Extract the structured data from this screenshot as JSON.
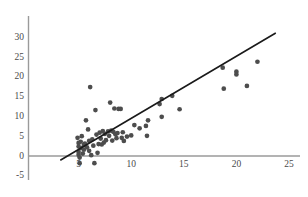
{
  "chart_data": {
    "type": "scatter",
    "title": "",
    "xlabel": "",
    "ylabel": "",
    "xlim": [
      0,
      25
    ],
    "ylim": [
      -5,
      30
    ],
    "xticks": [
      5,
      10,
      15,
      20,
      25
    ],
    "yticks": [
      -5,
      0,
      5,
      10,
      15,
      20,
      25,
      30
    ],
    "xtick_labels": [
      "5",
      "10",
      "15",
      "20",
      "25"
    ],
    "ytick_labels": [
      "-5",
      "0",
      "5",
      "10",
      "15",
      "20",
      "25",
      "30"
    ],
    "grid": false,
    "legend": null,
    "point_color": "#4d4d4d",
    "line_color": "#1a1a1a",
    "axis_color": "#9a9a9a",
    "series": [
      {
        "name": "observations",
        "marker": "circle",
        "points": [
          [
            4.9,
            4.6
          ],
          [
            5.0,
            3.3
          ],
          [
            5.0,
            2.4
          ],
          [
            5.0,
            1.0
          ],
          [
            5.0,
            0.3
          ],
          [
            5.1,
            -0.4
          ],
          [
            5.1,
            -1.8
          ],
          [
            5.2,
            2.0
          ],
          [
            5.2,
            3.6
          ],
          [
            5.3,
            5.0
          ],
          [
            5.4,
            0.6
          ],
          [
            5.5,
            2.8
          ],
          [
            5.5,
            1.6
          ],
          [
            5.6,
            3.1
          ],
          [
            5.7,
            9.0
          ],
          [
            5.8,
            2.2
          ],
          [
            5.9,
            6.7
          ],
          [
            6.0,
            3.8
          ],
          [
            6.0,
            1.3
          ],
          [
            6.1,
            17.4
          ],
          [
            6.2,
            0.2
          ],
          [
            6.3,
            4.2
          ],
          [
            6.4,
            2.6
          ],
          [
            6.5,
            -1.8
          ],
          [
            6.6,
            11.6
          ],
          [
            6.7,
            5.4
          ],
          [
            6.8,
            0.8
          ],
          [
            6.9,
            3.0
          ],
          [
            7.0,
            5.9
          ],
          [
            7.1,
            4.4
          ],
          [
            7.2,
            2.9
          ],
          [
            7.3,
            6.3
          ],
          [
            7.4,
            3.4
          ],
          [
            7.5,
            5.6
          ],
          [
            7.6,
            4.0
          ],
          [
            7.8,
            6.2
          ],
          [
            7.9,
            5.1
          ],
          [
            8.0,
            13.5
          ],
          [
            8.1,
            6.4
          ],
          [
            8.2,
            3.9
          ],
          [
            8.3,
            6.1
          ],
          [
            8.4,
            12.0
          ],
          [
            8.5,
            5.5
          ],
          [
            8.6,
            4.5
          ],
          [
            8.7,
            5.8
          ],
          [
            8.8,
            11.9
          ],
          [
            9.0,
            11.9
          ],
          [
            9.1,
            4.6
          ],
          [
            9.2,
            6.0
          ],
          [
            9.3,
            3.8
          ],
          [
            9.6,
            4.9
          ],
          [
            10.0,
            5.2
          ],
          [
            10.3,
            7.8
          ],
          [
            10.8,
            7.0
          ],
          [
            11.4,
            7.6
          ],
          [
            11.5,
            5.1
          ],
          [
            11.6,
            9.0
          ],
          [
            12.7,
            13.1
          ],
          [
            12.9,
            14.4
          ],
          [
            12.9,
            9.9
          ],
          [
            13.9,
            15.2
          ],
          [
            14.6,
            11.8
          ],
          [
            18.7,
            22.3
          ],
          [
            18.8,
            17.0
          ],
          [
            20.0,
            21.3
          ],
          [
            20.0,
            20.6
          ],
          [
            21.0,
            17.7
          ],
          [
            22.0,
            23.8
          ]
        ]
      }
    ],
    "trendline": {
      "name": "fitted regression line",
      "x_start": 3.3,
      "y_start": -1.0,
      "x_end": 23.7,
      "y_end": 31.0
    }
  }
}
